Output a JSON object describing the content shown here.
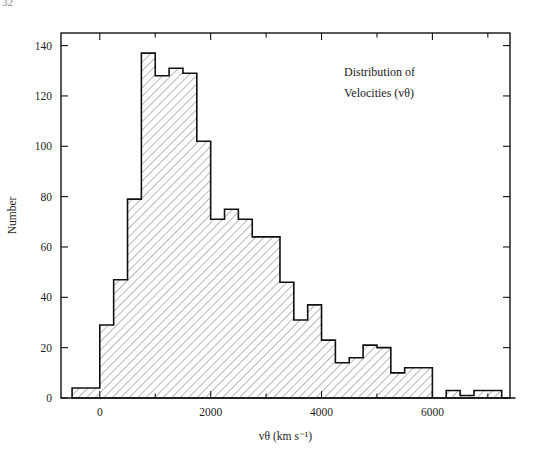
{
  "page": {
    "number": "32"
  },
  "figure": {
    "annotation_line1": "Distribution of",
    "annotation_line2": "Velocities (vθ)",
    "y_axis_title": "Number",
    "x_axis_title": "vθ (km s⁻¹)",
    "frame_color": "#111111",
    "hatch_color": "#555555",
    "background": "#ffffff"
  },
  "chart_data": {
    "type": "bar",
    "title": "Distribution of Velocities (vθ)",
    "xlabel": "vθ (km s⁻¹)",
    "ylabel": "Number",
    "xlim": [
      -700,
      7400
    ],
    "ylim": [
      0,
      145
    ],
    "xticks": [
      0,
      2000,
      4000,
      6000
    ],
    "xticklabels": [
      "0",
      "2000",
      "4000",
      "6000"
    ],
    "x_minor_ticks": [
      -1000,
      1000,
      3000,
      5000,
      7000
    ],
    "yticks": [
      0,
      20,
      40,
      60,
      80,
      100,
      120,
      140
    ],
    "yticklabels": [
      "0",
      "20",
      "40",
      "60",
      "80",
      "100",
      "120",
      "140"
    ],
    "grid": false,
    "legend": "none",
    "bin_width": 250,
    "bin_edges": [
      -500,
      -250,
      0,
      250,
      500,
      750,
      1000,
      1250,
      1500,
      1750,
      2000,
      2250,
      2500,
      2750,
      3000,
      3250,
      3500,
      3750,
      4000,
      4250,
      4500,
      4750,
      5000,
      5250,
      5500,
      5750,
      6000,
      6250,
      6500,
      6750,
      7000,
      7250
    ],
    "values": [
      4,
      4,
      29,
      47,
      79,
      137,
      128,
      131,
      129,
      102,
      71,
      75,
      71,
      64,
      64,
      46,
      31,
      37,
      23,
      14,
      16,
      21,
      20,
      10,
      12,
      12,
      0,
      3,
      1,
      3,
      3,
      0
    ],
    "categories": [
      "-500",
      "-250",
      "0",
      "250",
      "500",
      "750",
      "1000",
      "1250",
      "1500",
      "1750",
      "2000",
      "2250",
      "2500",
      "2750",
      "3000",
      "3250",
      "3500",
      "3750",
      "4000",
      "4250",
      "4500",
      "4750",
      "5000",
      "5250",
      "5500",
      "5750",
      "6000",
      "6250",
      "6500",
      "6750",
      "7000",
      "7250"
    ]
  }
}
